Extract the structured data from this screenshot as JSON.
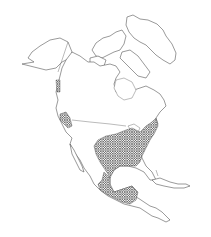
{
  "map": {
    "title": "",
    "region": "North America",
    "style": "outline map with crosshatched range",
    "colors": {
      "background": "#ffffff",
      "outline": "#555555",
      "hatch": "#333333"
    },
    "range_areas": [
      "Eastern and central United States",
      "Eastern and southern Mexico",
      "Central America (northern)",
      "Pacific Northwest coast patches"
    ]
  }
}
